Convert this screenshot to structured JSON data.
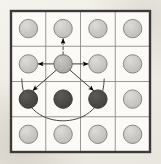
{
  "figure": {
    "background_color": "#f2f0ea",
    "grid": {
      "rows": 4,
      "cols": 4,
      "left": 11,
      "top": 11,
      "right": 150,
      "bottom": 152,
      "outer_border_color": "#3c3a37",
      "outer_border_width": 2.4,
      "inner_line_color": "#8e8b86",
      "inner_line_width": 0.9,
      "cell_fill": "#fbfaf7",
      "col_x": [
        11,
        45.75,
        80.5,
        115.25,
        150
      ],
      "row_y": [
        11,
        46.25,
        81.5,
        116.75,
        152
      ]
    },
    "node_style": {
      "radius": 9.2,
      "light_fill": "#c9c7c3",
      "light_stroke": "#8a8884",
      "center_fill": "#b4b2ae",
      "center_stroke": "#6f6d69",
      "dark_fill": "#4b4a48",
      "dark_stroke": "#3a3937",
      "stroke_width": 1.0,
      "highlight_color": "#dedcd8"
    },
    "nodes": [
      {
        "id": "n-r1c1",
        "name": "node-row1-col1",
        "row": 1,
        "col": 1,
        "cx": 28.4,
        "cy": 28.6,
        "state": "light"
      },
      {
        "id": "n-r1c2",
        "name": "node-row1-col2",
        "row": 1,
        "col": 2,
        "cx": 63.1,
        "cy": 28.6,
        "state": "light"
      },
      {
        "id": "n-r1c3",
        "name": "node-row1-col3",
        "row": 1,
        "col": 3,
        "cx": 97.9,
        "cy": 28.6,
        "state": "light"
      },
      {
        "id": "n-r1c4",
        "name": "node-row1-col4",
        "row": 1,
        "col": 4,
        "cx": 132.6,
        "cy": 28.6,
        "state": "light"
      },
      {
        "id": "n-r2c1",
        "name": "node-row2-col1",
        "row": 2,
        "col": 1,
        "cx": 28.4,
        "cy": 63.9,
        "state": "light"
      },
      {
        "id": "n-r2c2",
        "name": "node-row2-col2-source",
        "row": 2,
        "col": 2,
        "cx": 63.1,
        "cy": 63.9,
        "state": "center"
      },
      {
        "id": "n-r2c3",
        "name": "node-row2-col3",
        "row": 2,
        "col": 3,
        "cx": 97.9,
        "cy": 63.9,
        "state": "light"
      },
      {
        "id": "n-r2c4",
        "name": "node-row2-col4",
        "row": 2,
        "col": 4,
        "cx": 132.6,
        "cy": 63.9,
        "state": "light"
      },
      {
        "id": "n-r3c1",
        "name": "node-row3-col1",
        "row": 3,
        "col": 1,
        "cx": 28.4,
        "cy": 99.1,
        "state": "dark"
      },
      {
        "id": "n-r3c2",
        "name": "node-row3-col2",
        "row": 3,
        "col": 2,
        "cx": 63.1,
        "cy": 99.1,
        "state": "dark"
      },
      {
        "id": "n-r3c3",
        "name": "node-row3-col3",
        "row": 3,
        "col": 3,
        "cx": 97.9,
        "cy": 99.1,
        "state": "dark"
      },
      {
        "id": "n-r3c4",
        "name": "node-row3-col4",
        "row": 3,
        "col": 4,
        "cx": 132.6,
        "cy": 99.1,
        "state": "light"
      },
      {
        "id": "n-r4c1",
        "name": "node-row4-col1",
        "row": 4,
        "col": 1,
        "cx": 28.4,
        "cy": 134.3,
        "state": "light"
      },
      {
        "id": "n-r4c2",
        "name": "node-row4-col2",
        "row": 4,
        "col": 2,
        "cx": 63.1,
        "cy": 134.3,
        "state": "light"
      },
      {
        "id": "n-r4c3",
        "name": "node-row4-col3",
        "row": 4,
        "col": 3,
        "cx": 97.9,
        "cy": 134.3,
        "state": "light"
      },
      {
        "id": "n-r4c4",
        "name": "node-row4-col4",
        "row": 4,
        "col": 4,
        "cx": 132.6,
        "cy": 134.3,
        "state": "light"
      }
    ],
    "arrows": [
      {
        "id": "a-up",
        "name": "arrow-up-dashed",
        "from": "n-r2c2",
        "to": "n-r1c2",
        "style": "dashed",
        "color": "#4a4845",
        "width": 1.0,
        "dash": "2.6,2.2",
        "x1": 63.1,
        "y1": 54.4,
        "x2": 63.1,
        "y2": 38.6
      },
      {
        "id": "a-left",
        "name": "arrow-left-solid",
        "from": "n-r2c2",
        "to": "n-r2c1",
        "style": "solid",
        "color": "#3e3c3a",
        "width": 1.0,
        "x1": 53.6,
        "y1": 63.9,
        "x2": 38.2,
        "y2": 63.9
      },
      {
        "id": "a-right",
        "name": "arrow-right-solid",
        "from": "n-r2c2",
        "to": "n-r2c3",
        "style": "solid",
        "color": "#3e3c3a",
        "width": 1.0,
        "x1": 72.6,
        "y1": 63.9,
        "x2": 88.1,
        "y2": 63.9
      },
      {
        "id": "a-down-left",
        "name": "arrow-diagonal-down-left",
        "from": "n-r2c2",
        "to": "n-r3c1",
        "style": "solid",
        "color": "#3e3c3a",
        "width": 1.0,
        "x1": 56.2,
        "y1": 70.2,
        "x2": 32.8,
        "y2": 90.6
      },
      {
        "id": "a-down-right",
        "name": "arrow-diagonal-down-right",
        "from": "n-r2c2",
        "to": "n-r3c3",
        "style": "solid",
        "color": "#3e3c3a",
        "width": 1.0,
        "x1": 70.1,
        "y1": 70.2,
        "x2": 93.6,
        "y2": 90.6
      }
    ],
    "arc": {
      "id": "arc-bottom",
      "name": "arc-connector-bottom",
      "color": "#4a4845",
      "width": 1.0,
      "path": "M 21.8 79.0 C 22.5 112.5 47.0 120.8 63.1 120.8 C 79.2 120.8 103.5 112.5 104.2 79.0",
      "start_x": 21.8,
      "start_y": 79.0,
      "end_x": 104.2,
      "end_y": 79.0,
      "lowest_y": 120.8
    },
    "arrowhead": {
      "name": "arrowhead-marker",
      "color": "#39[REDACTED]",
      "length": 5.0,
      "halfwidth": 2.4
    }
  }
}
